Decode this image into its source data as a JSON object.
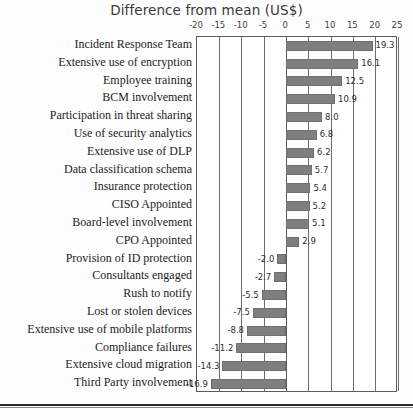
{
  "chart_data": {
    "type": "bar",
    "orientation": "horizontal",
    "title": "Difference from mean (US$)",
    "xlabel": "",
    "ylabel": "",
    "xlim": [
      -20,
      25
    ],
    "xticks": [
      -20,
      -15,
      -10,
      -5,
      0,
      5,
      10,
      15,
      20,
      25
    ],
    "xtick_labels": [
      "-20",
      "-15",
      "-10",
      "-5",
      "0",
      "5",
      "10",
      "15",
      "20",
      "25"
    ],
    "grid": true,
    "legend": false,
    "bar_color": "#7f7f7f",
    "categories": [
      "Incident Response Team",
      "Extensive use of encryption",
      "Employee training",
      "BCM involvement",
      "Participation in threat sharing",
      "Use of security analytics",
      "Extensive use of DLP",
      "Data classification schema",
      "Insurance protection",
      "CISO Appointed",
      "Board-level involvement",
      "CPO Appointed",
      "Provision of ID protection",
      "Consultants engaged",
      "Rush to notify",
      "Lost or stolen devices",
      "Extensive use of mobile platforms",
      "Compliance failures",
      "Extensive cloud migration",
      "Third Party involvement"
    ],
    "values": [
      19.3,
      16.1,
      12.5,
      10.9,
      8.0,
      6.8,
      6.2,
      5.7,
      5.4,
      5.2,
      5.1,
      2.9,
      -2.0,
      -2.7,
      -5.5,
      -7.5,
      -8.8,
      -11.2,
      -14.3,
      -16.9
    ],
    "value_labels": [
      "19.3",
      "16.1",
      "12.5",
      "10.9",
      "8.0",
      "6.8",
      "6.2",
      "5.7",
      "5.4",
      "5.2",
      "5.1",
      "2.9",
      "-2.0",
      "-2.7",
      "-5.5",
      "-7.5",
      "-8.8",
      "-11.2",
      "-14.3",
      "-16.9"
    ]
  }
}
